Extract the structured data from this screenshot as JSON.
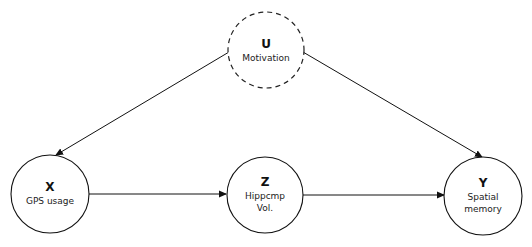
{
  "diagram": {
    "type": "causal-dag",
    "nodes": [
      {
        "id": "U",
        "letter": "U",
        "label_lines": [
          "Motivation"
        ],
        "style": "dashed",
        "observed": false
      },
      {
        "id": "X",
        "letter": "X",
        "label_lines": [
          "GPS usage"
        ],
        "style": "solid",
        "observed": true
      },
      {
        "id": "Z",
        "letter": "Z",
        "label_lines": [
          "Hippcmp",
          "Vol."
        ],
        "style": "solid",
        "observed": true
      },
      {
        "id": "Y",
        "letter": "Y",
        "label_lines": [
          "Spatial",
          "memory"
        ],
        "style": "solid",
        "observed": true
      }
    ],
    "edges": [
      {
        "from": "U",
        "to": "X"
      },
      {
        "from": "U",
        "to": "Y"
      },
      {
        "from": "X",
        "to": "Z"
      },
      {
        "from": "Z",
        "to": "Y"
      }
    ],
    "colors": {
      "stroke": "#111111",
      "background": "#ffffff"
    }
  }
}
